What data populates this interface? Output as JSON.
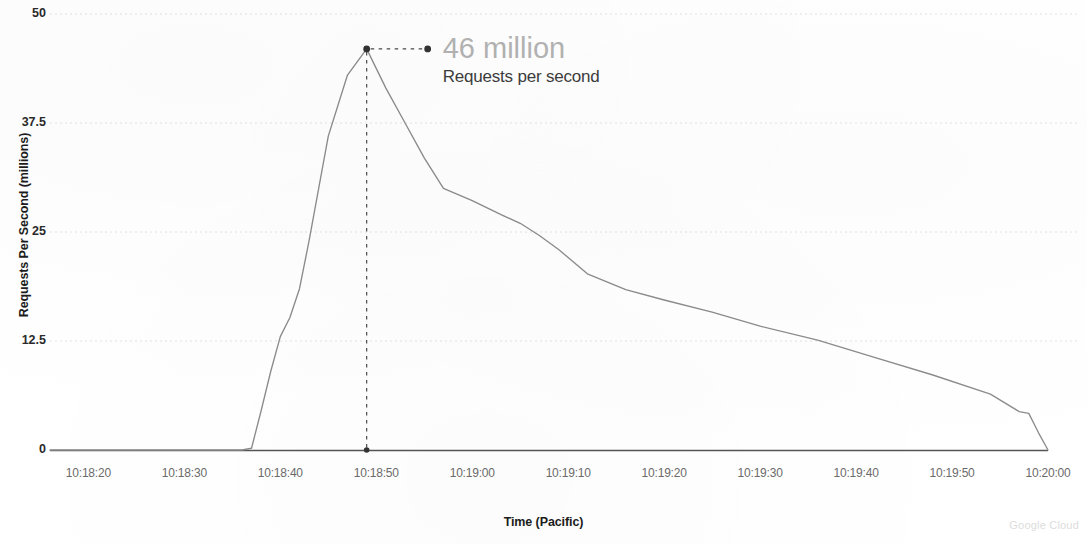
{
  "chart_data": {
    "type": "line",
    "title": "",
    "xlabel": "Time (Pacific)",
    "ylabel": "Requests Per Second (millions)",
    "ylim": [
      0,
      50
    ],
    "yticks": [
      0,
      12.5,
      25,
      37.5,
      50
    ],
    "ytick_labels": [
      "0",
      "12.5",
      "25",
      "37.5",
      "50"
    ],
    "grid": true,
    "grid_axis": "y",
    "legend": "none",
    "xtick_labels": [
      "10:18:20",
      "10:18:30",
      "10:18:40",
      "10:18:50",
      "10:19:00",
      "10:19:10",
      "10:19:20",
      "10:19:30",
      "10:19:40",
      "10:19:50",
      "10:20:00"
    ],
    "xlim": [
      "10:18:16",
      "10:20:00"
    ],
    "series": [
      {
        "name": "Requests per second",
        "color": "#8c8c8c",
        "x": [
          "10:18:16",
          "10:18:20",
          "10:18:25",
          "10:18:30",
          "10:18:34",
          "10:18:36",
          "10:18:37",
          "10:18:38",
          "10:18:39",
          "10:18:40",
          "10:18:41",
          "10:18:42",
          "10:18:43",
          "10:18:44",
          "10:18:45",
          "10:18:47",
          "10:18:49",
          "10:18:51",
          "10:18:53",
          "10:18:55",
          "10:18:57",
          "10:19:00",
          "10:19:03",
          "10:19:05",
          "10:19:07",
          "10:19:09",
          "10:19:12",
          "10:19:16",
          "10:19:20",
          "10:19:25",
          "10:19:30",
          "10:19:36",
          "10:19:42",
          "10:19:48",
          "10:19:54",
          "10:19:57",
          "10:19:58",
          "10:19:59",
          "10:20:00"
        ],
        "y": [
          0,
          0,
          0,
          0,
          0,
          0,
          0.2,
          4.5,
          9.0,
          13.0,
          15.2,
          18.5,
          24.0,
          30.0,
          36.0,
          43.0,
          46.0,
          41.5,
          37.5,
          33.5,
          30.0,
          28.6,
          27.0,
          26.0,
          24.6,
          23.0,
          20.2,
          18.4,
          17.2,
          15.8,
          14.2,
          12.6,
          10.6,
          8.6,
          6.4,
          4.4,
          4.2,
          2.0,
          0
        ]
      }
    ],
    "annotations": [
      {
        "label": "46 million",
        "sublabel": "Requests per second",
        "point_x": "10:18:49",
        "point_y": 46,
        "value": 46,
        "units": "million",
        "leader": "dashed-horizontal",
        "dropline": "dashed-vertical-to-zero"
      }
    ]
  },
  "axes": {
    "y_title": "Requests Per Second (millions)",
    "x_title": "Time (Pacific)",
    "y_tick_labels": [
      "50",
      "37.5",
      "25",
      "12.5",
      "0"
    ],
    "x_tick_labels": [
      "10:18:20",
      "10:18:30",
      "10:18:40",
      "10:18:50",
      "10:19:00",
      "10:19:10",
      "10:19:20",
      "10:19:30",
      "10:19:40",
      "10:19:50",
      "10:20:00"
    ]
  },
  "annotation": {
    "value_text": "46 million",
    "caption_text": "Requests per second"
  },
  "branding": {
    "watermark": "Google Cloud"
  },
  "colors": {
    "line": "#8c8c8c",
    "grid": "#e2e2e2",
    "axis": "#555555",
    "annotation_value": "#b3b3b3",
    "annotation_caption": "#3c3c3c",
    "tick_text": "#6b6b6b",
    "title_text": "#1c1c1c",
    "watermark": "#dcdcdc"
  }
}
